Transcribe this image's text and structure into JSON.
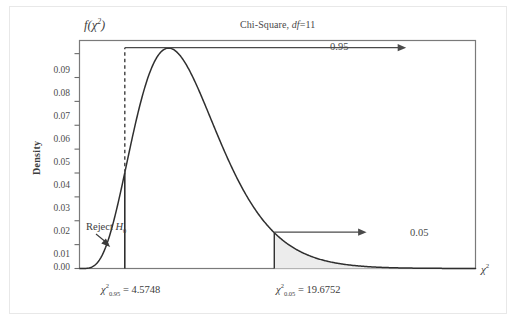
{
  "chart_data": {
    "type": "line",
    "title_main": "Chi-Square,",
    "title_df_italic": "df",
    "title_df_value": "=11",
    "df": 11,
    "xlabel": "χ²",
    "ylabel": "Density",
    "y_top_label": "f(χ²)",
    "ylim": [
      0,
      0.0955
    ],
    "xlim": [
      0,
      40
    ],
    "grid": false,
    "ytick_labels": [
      "0.09",
      "0.08",
      "0.07",
      "0.06",
      "0.05",
      "0.04",
      "0.03",
      "0.02",
      "0.01",
      "0.00"
    ],
    "ytick_values": [
      0.09,
      0.08,
      0.07,
      0.06,
      0.05,
      0.04,
      0.03,
      0.02,
      0.01,
      0.0
    ],
    "curve_peak_x": 9,
    "curve_peak_y": 0.0934,
    "annotations": [
      {
        "name": "upper-area",
        "label": "0.95",
        "from_x": 4.5748,
        "to_x": 33.0,
        "y": 0.0925
      },
      {
        "name": "tail-area",
        "label": "0.05",
        "from_x": 19.6752,
        "to_x": 29.0,
        "y": 0.0152
      },
      {
        "name": "reject-region",
        "label": "Reject H₀",
        "label_main": "Reject",
        "label_h": "H",
        "label_sub": "0",
        "point_x": 3.1,
        "point_y": 0.002
      }
    ],
    "critical_values": [
      {
        "name": "lower-critical",
        "text": "χ²₀.₉₅ = 4.5748",
        "symbol": "χ",
        "sup": "2",
        "sub": "0.95",
        "eq": "= 4.5748",
        "value": 4.5748,
        "density_at": 0.0397
      },
      {
        "name": "upper-critical",
        "text": "χ²₀.₀₅ = 19.6752",
        "symbol": "χ",
        "sup": "2",
        "sub": "0.05",
        "eq": "= 19.6752",
        "value": 19.6752,
        "density_at": 0.0152
      }
    ],
    "shaded_region": {
      "name": "right-tail-shading",
      "from_x": 19.6752,
      "to_x": 40,
      "color": "#ececec"
    },
    "colors": {
      "curve": "#2f2f2f",
      "axis": "#6b6b6b",
      "frame": "#7a7a7a",
      "shade": "#ececec",
      "text": "#3d3d3d",
      "outer_border": "#e8e8e8"
    }
  }
}
